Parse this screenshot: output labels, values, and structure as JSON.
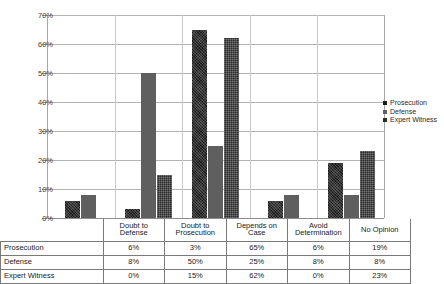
{
  "chart_data": {
    "type": "bar",
    "title": "",
    "xlabel": "",
    "ylabel": "",
    "ylim": [
      0,
      70
    ],
    "ytick_labels": [
      "70%",
      "60%",
      "50%",
      "40%",
      "30%",
      "20%",
      "10%",
      "0%"
    ],
    "ytick_values": [
      70,
      60,
      50,
      40,
      30,
      20,
      10,
      0
    ],
    "grid": true,
    "legend_position": "right",
    "categories": [
      "Doubt to Defense",
      "Doubt to Prosecution",
      "Depends on Case",
      "Avoid Determination",
      "No Opinion"
    ],
    "series": [
      {
        "name": "Prosecution",
        "values": [
          6,
          3,
          65,
          6,
          19
        ],
        "labels": [
          "6%",
          "3%",
          "65%",
          "6%",
          "19%"
        ]
      },
      {
        "name": "Defense",
        "values": [
          8,
          50,
          25,
          8,
          8
        ],
        "labels": [
          "8%",
          "50%",
          "25%",
          "8%",
          "8%"
        ]
      },
      {
        "name": "Expert Witness",
        "values": [
          0,
          15,
          62,
          0,
          23
        ],
        "labels": [
          "0%",
          "15%",
          "62%",
          "0%",
          "23%"
        ]
      }
    ]
  },
  "legend": {
    "items": [
      {
        "label": "Prosecution"
      },
      {
        "label": "Defense"
      },
      {
        "label": "Expert Witness"
      }
    ]
  },
  "table": {
    "category_headers": [
      "Doubt to Defense",
      "Doubt to Prosecution",
      "Depends on Case",
      "Avoid Determination",
      "No Opinion"
    ],
    "rows": [
      {
        "header": "Prosecution",
        "cells": [
          "6%",
          "3%",
          "65%",
          "6%",
          "19%"
        ]
      },
      {
        "header": "Defense",
        "cells": [
          "8%",
          "50%",
          "25%",
          "8%",
          "8%"
        ]
      },
      {
        "header": "Expert Witness",
        "cells": [
          "0%",
          "15%",
          "62%",
          "0%",
          "23%"
        ]
      }
    ]
  }
}
